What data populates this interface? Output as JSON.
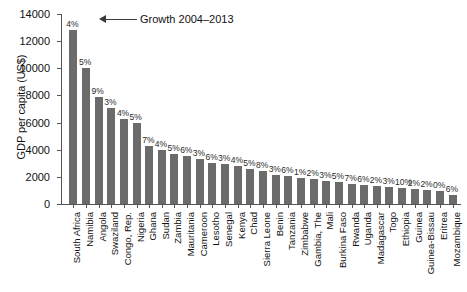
{
  "chart_data": {
    "type": "bar",
    "title": "",
    "xlabel": "",
    "ylabel": "GDP per capita (US$)",
    "ylim": [
      0,
      14000
    ],
    "yticks": [
      0,
      2000,
      4000,
      6000,
      8000,
      10000,
      12000,
      14000
    ],
    "ytick_labels": [
      "0",
      "2000",
      "4000",
      "6000",
      "8000",
      "10000",
      "12000",
      "14000"
    ],
    "grid": false,
    "legend": "none",
    "annotation": {
      "text": "Growth 2004–2013",
      "target_category": "South Africa",
      "style": "arrow pointing left to first bar's data label"
    },
    "bar_color": "#6b6b6b",
    "categories": [
      "South Africa",
      "Namibia",
      "Angola",
      "Swaziland",
      "Congo, Rep.",
      "Nigeria",
      "Ghana",
      "Sudan",
      "Zambia",
      "Mauritania",
      "Cameroon",
      "Lesotho",
      "Senegal",
      "Kenya",
      "Chad",
      "Sierra Leone",
      "Benin",
      "Tanzania",
      "Zimbabwe",
      "Gambia, The",
      "Mali",
      "Burkina Faso",
      "Rwanda",
      "Uganda",
      "Madagascar",
      "Togo",
      "Ethiopia",
      "Guinea",
      "Guinea-Bissau",
      "Eritrea",
      "Mozambique"
    ],
    "values": [
      12800,
      10000,
      7900,
      7050,
      6250,
      5950,
      4300,
      4000,
      3700,
      3550,
      3350,
      3050,
      2950,
      2800,
      2600,
      2400,
      2150,
      2050,
      1950,
      1850,
      1700,
      1600,
      1500,
      1400,
      1300,
      1250,
      1200,
      1100,
      1050,
      950,
      650
    ],
    "data_labels": [
      "4%",
      "5%",
      "9%",
      "3%",
      "4%",
      "5%",
      "7%",
      "4%",
      "5%",
      "6%",
      "3%",
      "6%",
      "3%",
      "4%",
      "5%",
      "8%",
      "3%",
      "6%",
      "1%",
      "2%",
      "3%",
      "5%",
      "7%",
      "6%",
      "2%",
      "3%",
      "10%",
      "2%",
      "2%",
      "0%",
      "6%"
    ],
    "value_units": "US$",
    "label_units": "percent annual growth 2004-2013"
  }
}
